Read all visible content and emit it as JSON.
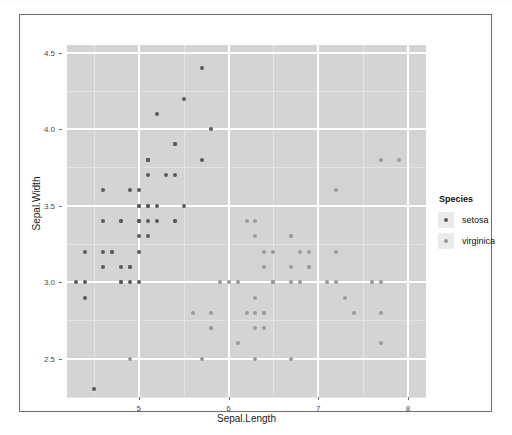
{
  "chart_data": {
    "type": "scatter",
    "title": "",
    "xlabel": "Sepal.Length",
    "ylabel": "Sepal.Width",
    "xlim": [
      4.2,
      8.2
    ],
    "ylim": [
      2.25,
      4.55
    ],
    "xticks": [
      5,
      6,
      7,
      8
    ],
    "xtick_labels": [
      "5",
      "6",
      "7",
      "8"
    ],
    "yticks": [
      2.5,
      3.0,
      3.5,
      4.0,
      4.5
    ],
    "ytick_labels": [
      "2.5",
      "3.0",
      "3.5",
      "4.0",
      "4.5"
    ],
    "grid": true,
    "panel_color": "#d4d4d4",
    "gridline_major_color": "#ffffff",
    "gridline_minor_color": "#e4e4e4",
    "legend": {
      "title": "Species",
      "position": "right",
      "entries": [
        {
          "name": "setosa",
          "color": "#5a5a5a"
        },
        {
          "name": "virginica",
          "color": "#9a9a9a"
        }
      ]
    },
    "series": [
      {
        "name": "setosa",
        "color": "#5a5a5a",
        "points": [
          [
            5.1,
            3.5
          ],
          [
            4.9,
            3.0
          ],
          [
            4.7,
            3.2
          ],
          [
            4.6,
            3.1
          ],
          [
            5.0,
            3.6
          ],
          [
            5.4,
            3.9
          ],
          [
            4.6,
            3.4
          ],
          [
            5.0,
            3.4
          ],
          [
            4.4,
            2.9
          ],
          [
            4.9,
            3.1
          ],
          [
            5.4,
            3.7
          ],
          [
            4.8,
            3.4
          ],
          [
            4.8,
            3.0
          ],
          [
            4.3,
            3.0
          ],
          [
            5.8,
            4.0
          ],
          [
            5.7,
            4.4
          ],
          [
            5.4,
            3.9
          ],
          [
            5.1,
            3.5
          ],
          [
            5.7,
            3.8
          ],
          [
            5.1,
            3.8
          ],
          [
            5.4,
            3.4
          ],
          [
            5.1,
            3.7
          ],
          [
            4.6,
            3.6
          ],
          [
            5.1,
            3.3
          ],
          [
            4.8,
            3.4
          ],
          [
            5.0,
            3.0
          ],
          [
            5.0,
            3.4
          ],
          [
            5.2,
            3.5
          ],
          [
            5.2,
            3.4
          ],
          [
            4.7,
            3.2
          ],
          [
            4.8,
            3.1
          ],
          [
            5.4,
            3.4
          ],
          [
            5.2,
            4.1
          ],
          [
            5.5,
            4.2
          ],
          [
            4.9,
            3.1
          ],
          [
            5.0,
            3.2
          ],
          [
            5.5,
            3.5
          ],
          [
            4.9,
            3.6
          ],
          [
            4.4,
            3.0
          ],
          [
            5.1,
            3.4
          ],
          [
            5.0,
            3.5
          ],
          [
            4.5,
            2.3
          ],
          [
            4.4,
            3.2
          ],
          [
            5.0,
            3.5
          ],
          [
            5.1,
            3.8
          ],
          [
            4.8,
            3.0
          ],
          [
            5.1,
            3.8
          ],
          [
            4.6,
            3.2
          ],
          [
            5.3,
            3.7
          ],
          [
            5.0,
            3.3
          ]
        ]
      },
      {
        "name": "virginica",
        "color": "#9a9a9a",
        "points": [
          [
            6.3,
            3.3
          ],
          [
            5.8,
            2.7
          ],
          [
            7.1,
            3.0
          ],
          [
            6.3,
            2.9
          ],
          [
            6.5,
            3.0
          ],
          [
            7.6,
            3.0
          ],
          [
            4.9,
            2.5
          ],
          [
            7.3,
            2.9
          ],
          [
            6.7,
            2.5
          ],
          [
            7.2,
            3.6
          ],
          [
            6.5,
            3.2
          ],
          [
            6.4,
            2.7
          ],
          [
            6.8,
            3.0
          ],
          [
            5.7,
            2.5
          ],
          [
            5.8,
            2.8
          ],
          [
            6.4,
            3.2
          ],
          [
            6.5,
            3.0
          ],
          [
            7.7,
            3.8
          ],
          [
            7.7,
            2.6
          ],
          [
            6.0,
            2.2
          ],
          [
            6.9,
            3.2
          ],
          [
            5.6,
            2.8
          ],
          [
            7.7,
            2.8
          ],
          [
            6.3,
            2.7
          ],
          [
            6.7,
            3.3
          ],
          [
            7.2,
            3.2
          ],
          [
            6.2,
            2.8
          ],
          [
            6.1,
            3.0
          ],
          [
            6.4,
            2.8
          ],
          [
            7.2,
            3.0
          ],
          [
            7.4,
            2.8
          ],
          [
            7.9,
            3.8
          ],
          [
            6.4,
            2.8
          ],
          [
            6.3,
            2.8
          ],
          [
            6.1,
            2.6
          ],
          [
            7.7,
            3.0
          ],
          [
            6.3,
            3.4
          ],
          [
            6.4,
            3.1
          ],
          [
            6.0,
            3.0
          ],
          [
            6.9,
            3.1
          ],
          [
            6.7,
            3.1
          ],
          [
            6.9,
            3.1
          ],
          [
            5.8,
            2.7
          ],
          [
            6.8,
            3.2
          ],
          [
            6.7,
            3.3
          ],
          [
            6.7,
            3.0
          ],
          [
            6.3,
            2.5
          ],
          [
            6.5,
            3.0
          ],
          [
            6.2,
            3.4
          ],
          [
            5.9,
            3.0
          ]
        ]
      }
    ]
  }
}
